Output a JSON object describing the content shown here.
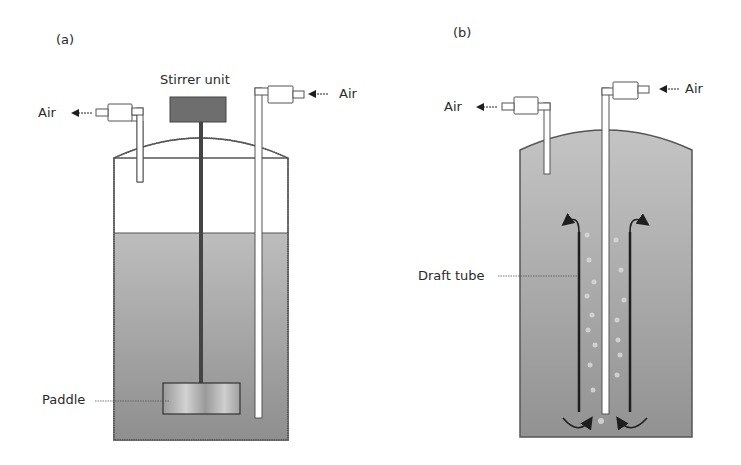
{
  "panels": [
    {
      "id": "a",
      "label": "(a)",
      "title": "Stirred tank fermenter",
      "labels": {
        "stirrer": "Stirrer unit",
        "air_out": "Air",
        "air_in": "Air",
        "paddle": "Paddle"
      }
    },
    {
      "id": "b",
      "label": "(b)",
      "title": "Airlift fermenter",
      "labels": {
        "air_out": "Air",
        "air_in": "Air",
        "draft_tube": "Draft tube"
      }
    }
  ],
  "colors": {
    "liquid": "#a9a9a9",
    "liquid_dark": "#8e8e8e",
    "outline": "#4a4a4a",
    "stirrer": "#6e6e6e",
    "shaft": "#444444",
    "arrow": "#1e1e1e"
  }
}
